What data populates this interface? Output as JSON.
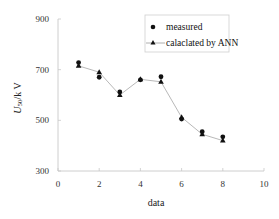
{
  "chart_data": {
    "type": "line",
    "title": "",
    "xlabel": "data",
    "ylabel": "U 50/k V",
    "ylabel_parts": {
      "main": "U",
      "sub": "50",
      "unit": "/k V"
    },
    "xlim": [
      0,
      10
    ],
    "ylim": [
      300,
      900
    ],
    "xticks": [
      0,
      2,
      4,
      6,
      8,
      10
    ],
    "yticks": [
      300,
      500,
      700,
      900
    ],
    "grid": false,
    "legend_position": "upper right",
    "x": [
      1,
      2,
      3,
      4,
      5,
      6,
      7,
      8
    ],
    "series": [
      {
        "name": "measured",
        "marker": "circle",
        "line": false,
        "values": [
          728,
          670,
          612,
          660,
          672,
          505,
          455,
          435
        ]
      },
      {
        "name": "calaclated by ANN",
        "marker": "triangle",
        "line": true,
        "values": [
          715,
          690,
          600,
          662,
          652,
          512,
          445,
          420
        ]
      }
    ]
  },
  "legend": {
    "items": [
      {
        "label": "measured"
      },
      {
        "label": "calaclated by ANN"
      }
    ]
  },
  "colors": {
    "axis": "#c8c8c8",
    "line": "#b0b0b0",
    "marker": "#111111"
  }
}
